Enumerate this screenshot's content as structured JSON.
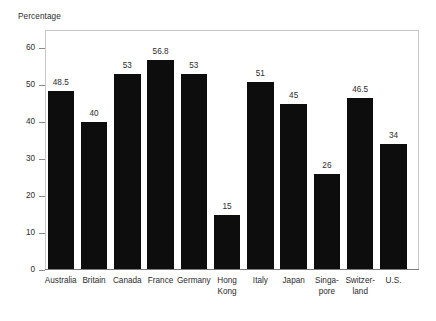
{
  "chart_data": {
    "type": "bar",
    "title": "",
    "ylabel": "Percentage",
    "xlabel": "",
    "ylim": [
      0,
      65
    ],
    "yticks": [
      0,
      10,
      20,
      30,
      40,
      50,
      60
    ],
    "ytick_labels": [
      "0",
      "10",
      "20",
      "30",
      "40",
      "50",
      "60"
    ],
    "grid": false,
    "legend": null,
    "bar_color": "#0d0d0d",
    "frame_color": "#c9c9c9",
    "axis_color": "#7a7a7a",
    "categories": [
      "Australia",
      "Britain",
      "Canada",
      "France",
      "Germany",
      "Hong Kong",
      "Italy",
      "Japan",
      "Singapore",
      "Switzerland",
      "U.S."
    ],
    "category_label_lines": [
      [
        "Australia"
      ],
      [
        "Britain"
      ],
      [
        "Canada"
      ],
      [
        "France"
      ],
      [
        "Germany"
      ],
      [
        "Hong",
        "Kong"
      ],
      [
        "Italy"
      ],
      [
        "Japan"
      ],
      [
        "Singa-",
        "pore"
      ],
      [
        "Switzer-",
        "land"
      ],
      [
        "U.S."
      ]
    ],
    "values": [
      48.5,
      40,
      53,
      56.8,
      53,
      15,
      51,
      45,
      26,
      46.5,
      34
    ],
    "value_labels": [
      "48.5",
      "40",
      "53",
      "56.8",
      "53",
      "15",
      "51",
      "45",
      "26",
      "46.5",
      "34"
    ]
  }
}
